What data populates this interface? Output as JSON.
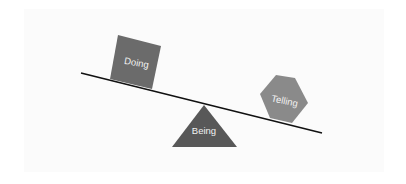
{
  "diagram": {
    "type": "seesaw-balance",
    "colors": {
      "background": "#ffffff",
      "panel": "#fbfbfb",
      "beam": "#111111",
      "doing_fill": "#6b6b6b",
      "telling_fill": "#8a8a8a",
      "being_fill": "#585858",
      "label_text": "#f2f2f2"
    },
    "beam": {
      "x1": 81,
      "y1": 73,
      "x2": 322,
      "y2": 133
    },
    "shapes": [
      {
        "id": "doing",
        "shape": "square",
        "label": "Doing",
        "position": "left end, resting on beam (heavier side, lower)"
      },
      {
        "id": "telling",
        "shape": "hexagon",
        "label": "Telling",
        "position": "right end, resting on beam"
      },
      {
        "id": "being",
        "shape": "triangle",
        "label": "Being",
        "position": "fulcrum under center of beam"
      }
    ],
    "labels": {
      "doing": "Doing",
      "telling": "Telling",
      "being": "Being"
    }
  }
}
